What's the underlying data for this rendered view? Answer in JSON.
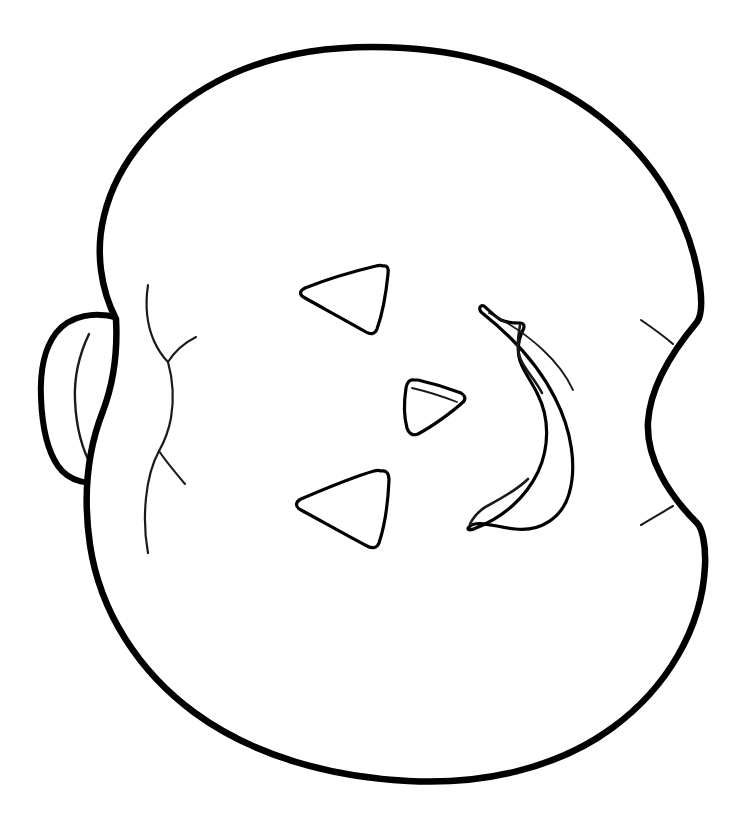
{
  "artwork": {
    "title": "Jack-o'-Lantern Coloring Page",
    "subject": "pumpkin",
    "style": "black-and-white line art / coloring book outline",
    "orientation": "rotated 90 degrees - stem points to the left",
    "canvas": {
      "width": 755,
      "height": 816
    },
    "colors": {
      "background": "#ffffff",
      "outline": "#000000",
      "detail_line": "#1a1a1a",
      "fill": "#ffffff"
    },
    "stroke_widths": {
      "body_outline": 6.5,
      "stem_outline": 6,
      "face_cutout": 3.2,
      "ridge_detail": 2.2,
      "sliver_detail": 1.8
    },
    "parts": [
      {
        "name": "pumpkin-body",
        "label": "Pumpkin body",
        "description": "Large rounded square blob occupying most of the canvas",
        "bbox": [
          85,
          45,
          712,
          778
        ]
      },
      {
        "name": "pumpkin-stem",
        "label": "Stem",
        "description": "Trumpet / funnel shaped stem attached on the left edge",
        "bbox": [
          40,
          310,
          140,
          485
        ]
      },
      {
        "name": "left-ridge-lines",
        "label": "Left rib lines",
        "description": "Thin curved rib lines separating the left lobe from the main body",
        "bbox": [
          138,
          282,
          215,
          560
        ]
      },
      {
        "name": "right-ridge-line",
        "label": "Right rib line",
        "description": "Thin curved rib line separating the right lobe from the main body",
        "bbox": [
          630,
          318,
          700,
          530
        ]
      },
      {
        "name": "eye-upper",
        "label": "Upper eye",
        "description": "Rounded triangle cutout pointing left",
        "bbox": [
          299,
          262,
          389,
          335
        ]
      },
      {
        "name": "eye-lower",
        "label": "Lower eye",
        "description": "Rounded triangle cutout pointing left",
        "bbox": [
          294,
          466,
          390,
          550
        ]
      },
      {
        "name": "nose",
        "label": "Nose",
        "description": "Small rounded triangle cutout pointing right with a thin inner sliver along its top edge",
        "bbox": [
          404,
          376,
          467,
          437
        ]
      },
      {
        "name": "mouth",
        "label": "Mouth",
        "description": "Crescent smile cutout with one tooth notch; rotated so the crescent opens to the left",
        "bbox": [
          466,
          303,
          580,
          530
        ]
      }
    ],
    "face_features": [
      {
        "name": "eye-upper",
        "label": "Upper eye",
        "shape": "triangle"
      },
      {
        "name": "eye-lower",
        "label": "Lower eye",
        "shape": "triangle"
      },
      {
        "name": "nose",
        "label": "Nose",
        "shape": "triangle"
      },
      {
        "name": "mouth",
        "label": "Mouth",
        "shape": "crescent-with-tooth"
      }
    ]
  }
}
